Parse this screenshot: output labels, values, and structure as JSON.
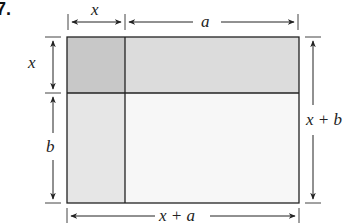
{
  "problem_number": "7.",
  "labels": {
    "top_left_width": "x",
    "top_right_width": "a",
    "left_top_height": "x",
    "left_bottom_height": "b",
    "right_total_height": "x + b",
    "bottom_total_width": "x + a"
  },
  "regions": [
    {
      "name": "x-by-x",
      "color": "#c8c8c8"
    },
    {
      "name": "a-by-x",
      "color": "#dcdcdc"
    },
    {
      "name": "x-by-b",
      "color": "#e6e6e6"
    },
    {
      "name": "a-by-b",
      "color": "#f7f7f7"
    }
  ],
  "colors": {
    "line": "#222222"
  }
}
